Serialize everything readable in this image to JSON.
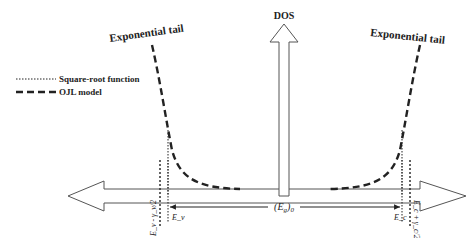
{
  "diagram": {
    "type": "band-structure-density-of-states",
    "axis": {
      "vertical_label": "DOS"
    },
    "labels": {
      "tail_left": "Exponential tail",
      "tail_right": "Exponential tail",
      "gap": "(E",
      "gap_sub": "g",
      "gap_close": ")",
      "gap_sub2": "0"
    },
    "legend": {
      "items": [
        {
          "name": "square-root",
          "label": "Square-root function",
          "style": "dotted"
        },
        {
          "name": "ojl",
          "label": "OJL model",
          "style": "dashed"
        }
      ]
    },
    "markers": {
      "left_outer": "E_v - γ_v/2",
      "left_inner": "E_v",
      "right_inner": "E_c",
      "right_outer": "E_c + γ_c/2"
    },
    "colors": {
      "stroke": "#222222",
      "arrow_outline": "#555555",
      "background": "#ffffff"
    }
  }
}
